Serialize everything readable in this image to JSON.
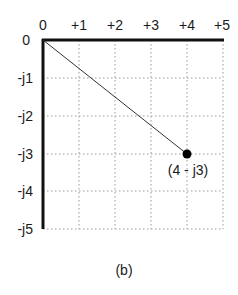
{
  "diagram": {
    "type": "complex-plane",
    "x_axis": {
      "ticks": [
        {
          "value": 0,
          "label": "0"
        },
        {
          "value": 1,
          "label": "+1"
        },
        {
          "value": 2,
          "label": "+2"
        },
        {
          "value": 3,
          "label": "+3"
        },
        {
          "value": 4,
          "label": "+4"
        },
        {
          "value": 5,
          "label": "+5"
        }
      ]
    },
    "y_axis": {
      "ticks": [
        {
          "value": 0,
          "label": "0"
        },
        {
          "value": -1,
          "label": "-j1"
        },
        {
          "value": -2,
          "label": "-j2"
        },
        {
          "value": -3,
          "label": "-j3"
        },
        {
          "value": -4,
          "label": "-j4"
        },
        {
          "value": -5,
          "label": "-j5"
        }
      ]
    },
    "vector": {
      "from": [
        0,
        0
      ],
      "to": [
        4,
        -3
      ]
    },
    "point": {
      "x": 4,
      "y": -3,
      "label": "(4 - j3)"
    },
    "caption": "(b)",
    "colors": {
      "axis": "#111111",
      "grid": "#9a9a9a",
      "vector": "#333333",
      "point": "#000000"
    }
  }
}
